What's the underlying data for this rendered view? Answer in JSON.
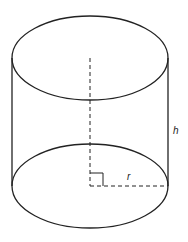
{
  "diagram": {
    "colors": {
      "stroke": "#222222",
      "background": "#ffffff"
    },
    "labels": {
      "height": "h",
      "radius": "r"
    },
    "shapes": {
      "top_ellipse": {
        "cx": 90,
        "cy": 58,
        "rx": 78,
        "ry": 42
      },
      "bottom_ellipse": {
        "cx": 90,
        "cy": 186,
        "rx": 78,
        "ry": 42
      },
      "left_side": {
        "x": 12,
        "y1": 58,
        "y2": 186
      },
      "right_side": {
        "x": 168,
        "y1": 58,
        "y2": 186
      },
      "axis_dashed": {
        "x": 90,
        "y1": 58,
        "y2": 186
      },
      "radius_dashed": {
        "x1": 90,
        "x2": 168,
        "y": 186
      },
      "right_angle_marker": {
        "x": 90,
        "y": 173,
        "size": 13
      }
    }
  }
}
